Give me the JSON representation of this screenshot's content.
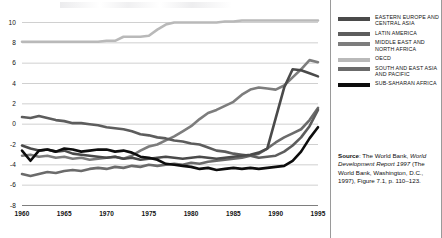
{
  "figure": {
    "divider_color": "#9a9a9a",
    "background": "#ffffff"
  },
  "chart_data": {
    "type": "line",
    "title": "",
    "subtitle": "",
    "xlabel": "",
    "ylabel": "",
    "xlim": [
      1960,
      1995
    ],
    "ylim": [
      -8,
      10
    ],
    "xticks": [
      1960,
      1965,
      1970,
      1975,
      1980,
      1985,
      1990,
      1995
    ],
    "xticklabels": [
      "1960",
      "1965",
      "1970",
      "1975",
      "1980",
      "1985",
      "1990",
      "1995"
    ],
    "yticks": [
      10,
      8,
      6,
      4,
      2,
      0,
      -2,
      -4,
      -6,
      -8
    ],
    "yticklabels": [
      "10",
      "8",
      "6",
      "4",
      "2",
      "0",
      "-2",
      "-4",
      "-6",
      "-8"
    ],
    "grid": true,
    "grid_color": "#a8a8a8",
    "legend_position": "right",
    "x": [
      1960,
      1961,
      1962,
      1963,
      1964,
      1965,
      1966,
      1967,
      1968,
      1969,
      1970,
      1971,
      1972,
      1973,
      1974,
      1975,
      1976,
      1977,
      1978,
      1979,
      1980,
      1981,
      1982,
      1983,
      1984,
      1985,
      1986,
      1987,
      1988,
      1989,
      1990,
      1991,
      1992,
      1993,
      1994,
      1995
    ],
    "series": [
      {
        "name": "EASTERN EUROPE AND CENTRAL ASIA",
        "color": "#4a4a4a",
        "values": [
          -2.1,
          -2.4,
          -2.6,
          -2.5,
          -2.7,
          -2.6,
          -2.9,
          -3.0,
          -3.1,
          -3.2,
          -3.3,
          -3.2,
          -3.4,
          -3.3,
          -3.5,
          -3.4,
          -3.3,
          -3.2,
          -3.3,
          -3.4,
          -3.3,
          -3.2,
          -3.3,
          -3.4,
          -3.3,
          -3.2,
          -3.1,
          -3.0,
          -2.8,
          -2.4,
          0.6,
          3.6,
          5.4,
          5.3,
          5.0,
          4.7
        ]
      },
      {
        "name": "LATIN AMERICA",
        "color": "#5d5d5d",
        "values": [
          0.7,
          0.6,
          0.8,
          0.6,
          0.4,
          0.3,
          0.1,
          0.1,
          0.0,
          -0.1,
          -0.3,
          -0.4,
          -0.5,
          -0.7,
          -1.0,
          -1.1,
          -1.3,
          -1.4,
          -1.6,
          -1.7,
          -1.9,
          -2.0,
          -2.3,
          -2.6,
          -2.7,
          -2.9,
          -3.0,
          -3.1,
          -3.3,
          -3.2,
          -3.1,
          -2.7,
          -2.1,
          -1.3,
          -0.2,
          1.4
        ]
      },
      {
        "name": "MIDDLE EAST AND NORTH AFRICA",
        "color": "#7d7d7d",
        "values": [
          -3.1,
          -3.0,
          -3.2,
          -3.1,
          -3.3,
          -3.2,
          -3.4,
          -3.3,
          -3.5,
          -3.4,
          -3.3,
          -3.2,
          -3.4,
          -3.1,
          -2.6,
          -2.2,
          -2.0,
          -1.6,
          -1.2,
          -0.7,
          -0.2,
          0.5,
          1.1,
          1.4,
          1.8,
          2.2,
          2.9,
          3.4,
          3.6,
          3.5,
          3.4,
          3.8,
          4.6,
          5.4,
          6.3,
          6.1
        ]
      },
      {
        "name": "OECD",
        "color": "#b9b9b9",
        "values": [
          8.1,
          8.1,
          8.1,
          8.1,
          8.1,
          8.1,
          8.1,
          8.1,
          8.1,
          8.1,
          8.2,
          8.2,
          8.6,
          8.6,
          8.6,
          8.7,
          9.3,
          9.8,
          10.0,
          10.0,
          10.0,
          10.0,
          10.0,
          10.0,
          10.1,
          10.1,
          10.2,
          10.2,
          10.2,
          10.2,
          10.2,
          10.2,
          10.2,
          10.2,
          10.2,
          10.2
        ]
      },
      {
        "name": "SOUTH AND EAST ASIA AND PACIFIC",
        "color": "#6b6b6b",
        "values": [
          -4.9,
          -5.1,
          -4.9,
          -4.7,
          -4.8,
          -4.6,
          -4.5,
          -4.6,
          -4.4,
          -4.3,
          -4.4,
          -4.2,
          -4.3,
          -4.1,
          -4.2,
          -4.0,
          -4.1,
          -4.0,
          -3.9,
          -4.0,
          -3.8,
          -3.9,
          -3.7,
          -3.6,
          -3.5,
          -3.4,
          -3.3,
          -3.1,
          -2.9,
          -2.4,
          -1.8,
          -1.3,
          -0.9,
          -0.5,
          0.4,
          1.6
        ]
      },
      {
        "name": "SUB-SAHARAN AFRICA",
        "color": "#0d0d0d",
        "values": [
          -2.6,
          -3.6,
          -2.6,
          -2.5,
          -2.7,
          -2.4,
          -2.5,
          -2.7,
          -2.6,
          -2.5,
          -2.5,
          -2.7,
          -2.6,
          -2.8,
          -3.2,
          -3.3,
          -3.5,
          -3.9,
          -4.0,
          -4.1,
          -4.2,
          -4.4,
          -4.3,
          -4.5,
          -4.4,
          -4.3,
          -4.4,
          -4.3,
          -4.4,
          -4.3,
          -4.2,
          -4.1,
          -3.6,
          -2.7,
          -1.4,
          -0.3
        ]
      }
    ]
  },
  "legend": {
    "items": [
      {
        "label": "EASTERN EUROPE AND CENTRAL ASIA",
        "color": "#4a4a4a"
      },
      {
        "label": "LATIN AMERICA",
        "color": "#5d5d5d"
      },
      {
        "label": "MIDDLE EAST AND NORTH AFRICA",
        "color": "#7d7d7d"
      },
      {
        "label": "OECD",
        "color": "#b9b9b9"
      },
      {
        "label": "SOUTH AND EAST ASIA AND PACIFIC",
        "color": "#6b6b6b"
      },
      {
        "label": "SUB-SAHARAN AFRICA",
        "color": "#0d0d0d"
      }
    ]
  },
  "source": {
    "label": "Source",
    "line1": ": The World Bank, ",
    "italic1": "World Development Report",
    "italic2": "1997",
    "rest": " (The World Bank, Washington, D.C., 1997), Figure 7.1, p. 110–123."
  }
}
